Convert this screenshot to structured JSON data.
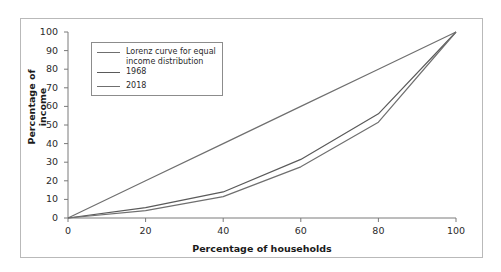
{
  "chart_data": {
    "type": "line",
    "title": "",
    "xlabel": "Percentage of households",
    "ylabel": "Percentage of income",
    "xlim": [
      0,
      100
    ],
    "ylim": [
      0,
      100
    ],
    "xticks": [
      0,
      20,
      40,
      60,
      80,
      100
    ],
    "yticks": [
      0,
      10,
      20,
      30,
      40,
      50,
      60,
      70,
      80,
      90,
      100
    ],
    "grid": false,
    "legend_position": "upper-left-inside",
    "x": [
      0,
      20,
      40,
      60,
      80,
      100
    ],
    "series": [
      {
        "name": "Lorenz curve for equal income distribution",
        "values": [
          0,
          20,
          40,
          60,
          80,
          100
        ],
        "color": "#6f6f6f"
      },
      {
        "name": "1968",
        "values": [
          0,
          5.6,
          14.0,
          31.5,
          56.0,
          100
        ],
        "color": "#5a5a5a"
      },
      {
        "name": "2018",
        "values": [
          0,
          4.0,
          11.5,
          27.5,
          51.5,
          100
        ],
        "color": "#6f6f6f"
      }
    ],
    "axis_color": "#7a7a7a"
  },
  "legend": {
    "entries": [
      "Lorenz curve for equal income distribution",
      "1968",
      "2018"
    ]
  },
  "ticks": {
    "y": [
      "100",
      "90",
      "80",
      "70",
      "60",
      "50",
      "40",
      "30",
      "20",
      "10",
      "0"
    ],
    "x": [
      "0",
      "20",
      "40",
      "60",
      "80",
      "100"
    ]
  },
  "labels": {
    "x_axis_title": "Percentage of households",
    "y_axis_title": "Percentage of income"
  }
}
